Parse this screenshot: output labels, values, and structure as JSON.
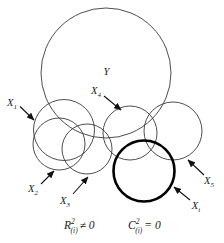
{
  "figure": {
    "type": "venn-overlap-diagram",
    "background": "#ffffff",
    "line_color": "#3a3a3a",
    "bold_line_color": "#000000",
    "text_color": "#1c1c1c"
  },
  "labels": {
    "y": {
      "main": "Y"
    },
    "x1": {
      "main": "X",
      "sub": "1"
    },
    "x2": {
      "main": "X",
      "sub": "2"
    },
    "x3": {
      "main": "X",
      "sub": "3"
    },
    "x4": {
      "main": "X",
      "sub": "4"
    },
    "x5": {
      "main": "X",
      "sub": "5"
    },
    "xi": {
      "main": "X",
      "sub": "i"
    }
  },
  "formulas": {
    "left": {
      "var": "R",
      "sup": "2",
      "sub": "(i)",
      "rest": "≠ 0"
    },
    "right": {
      "var": "C",
      "sup": "2",
      "sub": "(i)",
      "rest": "= 0"
    }
  }
}
